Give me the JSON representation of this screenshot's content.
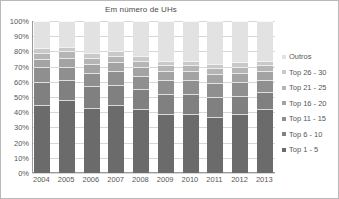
{
  "chart_data": {
    "type": "bar",
    "subtype": "100% stacked bar",
    "title": "Em número de UHs",
    "xlabel": "",
    "ylabel": "",
    "ylim": [
      0,
      100
    ],
    "grid": true,
    "legend_position": "right",
    "categories": [
      "2004",
      "2005",
      "2006",
      "2007",
      "2008",
      "2009",
      "2010",
      "2011",
      "2012",
      "2013"
    ],
    "ytick_labels": [
      "0%",
      "10%",
      "20%",
      "30%",
      "40%",
      "50%",
      "60%",
      "70%",
      "80%",
      "90%",
      "100%"
    ],
    "ytick_values": [
      0,
      10,
      20,
      30,
      40,
      50,
      60,
      70,
      80,
      90,
      100
    ],
    "series": [
      {
        "name": "Top 1 - 5",
        "color": "#6b6b6b",
        "values": [
          45,
          48,
          43,
          45,
          42,
          39,
          39,
          37,
          39,
          42
        ]
      },
      {
        "name": "Top 6 - 10",
        "color": "#808080",
        "values": [
          15,
          13,
          14,
          13,
          13,
          13,
          13,
          13,
          12,
          11
        ]
      },
      {
        "name": "Top 11 - 15",
        "color": "#8f8f8f",
        "values": [
          10,
          9,
          9,
          9,
          9,
          9,
          9,
          9,
          9,
          8
        ]
      },
      {
        "name": "Top 16 - 20",
        "color": "#a3a3a3",
        "values": [
          5,
          6,
          6,
          6,
          6,
          6,
          6,
          6,
          6,
          6
        ]
      },
      {
        "name": "Top 21 - 25",
        "color": "#b5b5b5",
        "values": [
          4,
          4,
          4,
          4,
          4,
          4,
          4,
          4,
          4,
          4
        ]
      },
      {
        "name": "Top 26 - 30",
        "color": "#c9c9c9",
        "values": [
          3,
          3,
          3,
          3,
          3,
          3,
          3,
          3,
          3,
          3
        ]
      },
      {
        "name": "Outros",
        "color": "#e2e2e2",
        "values": [
          18,
          17,
          21,
          20,
          23,
          26,
          26,
          28,
          27,
          26
        ]
      }
    ]
  },
  "legend": {
    "items": [
      {
        "label": "Outros",
        "color": "#e2e2e2"
      },
      {
        "label": "Top 26 - 30",
        "color": "#c9c9c9"
      },
      {
        "label": "Top 21 - 25",
        "color": "#b5b5b5"
      },
      {
        "label": "Top 16 - 20",
        "color": "#a3a3a3"
      },
      {
        "label": "Top 11 - 15",
        "color": "#8f8f8f"
      },
      {
        "label": "Top 6 - 10",
        "color": "#808080"
      },
      {
        "label": "Top 1 - 5",
        "color": "#6b6b6b"
      }
    ]
  }
}
